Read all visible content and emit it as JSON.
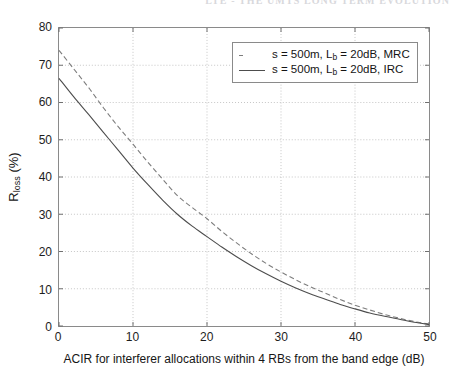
{
  "page": {
    "header_right": "LTE - THE UMTS LONG TERM EVOLUTION",
    "header_left": ""
  },
  "figure": {
    "ylabel_main": "R",
    "ylabel_sub": "loss",
    "ylabel_unit": " (%)",
    "xlabel": "ACIR for interferer allocations within 4 RBs from the band edge (dB)",
    "legend": [
      {
        "style": "dashed",
        "prefix": "s = 500m, L",
        "sub": "b",
        "suffix": " = 20dB, MRC",
        "color": "#7d7d7d"
      },
      {
        "style": "solid",
        "prefix": "s = 500m, L",
        "sub": "b",
        "suffix": " = 20dB, IRC",
        "color": "#4d4d4d"
      }
    ]
  },
  "chart_data": {
    "type": "line",
    "title": "",
    "xlabel": "ACIR for interferer allocations within 4 RBs from the band edge (dB)",
    "ylabel": "R_loss (%)",
    "xlim": [
      0,
      50
    ],
    "ylim": [
      0,
      80
    ],
    "xticks": [
      0,
      10,
      20,
      30,
      40,
      50
    ],
    "yticks": [
      0,
      10,
      20,
      30,
      40,
      50,
      60,
      70,
      80
    ],
    "grid": true,
    "legend_position": "upper right",
    "series": [
      {
        "name": "s = 500m, L_b = 20dB, MRC",
        "style": "dashed",
        "color": "#7d7d7d",
        "x": [
          0,
          2,
          4,
          6,
          8,
          10,
          12,
          14,
          16,
          18,
          20,
          22,
          24,
          26,
          28,
          30,
          32,
          34,
          36,
          38,
          40,
          42,
          44,
          46,
          48,
          50
        ],
        "y": [
          74.0,
          69.0,
          64.0,
          58.6,
          53.5,
          48.8,
          44.0,
          39.4,
          35.0,
          31.8,
          28.8,
          25.4,
          22.3,
          19.4,
          16.8,
          14.5,
          12.4,
          10.5,
          8.8,
          7.1,
          5.6,
          4.3,
          3.1,
          2.1,
          1.2,
          0.5
        ]
      },
      {
        "name": "s = 500m, L_b = 20dB, IRC",
        "style": "solid",
        "color": "#4d4d4d",
        "x": [
          0,
          2,
          4,
          6,
          8,
          10,
          12,
          14,
          16,
          18,
          20,
          22,
          24,
          26,
          28,
          30,
          32,
          34,
          36,
          38,
          40,
          42,
          44,
          46,
          48,
          50
        ],
        "y": [
          66.5,
          61.5,
          56.8,
          52.0,
          47.2,
          42.4,
          38.0,
          33.8,
          30.0,
          26.8,
          24.0,
          21.2,
          18.6,
          16.2,
          14.0,
          12.0,
          10.2,
          8.6,
          7.2,
          5.8,
          4.6,
          3.5,
          2.6,
          1.8,
          1.0,
          0.4
        ]
      }
    ]
  }
}
